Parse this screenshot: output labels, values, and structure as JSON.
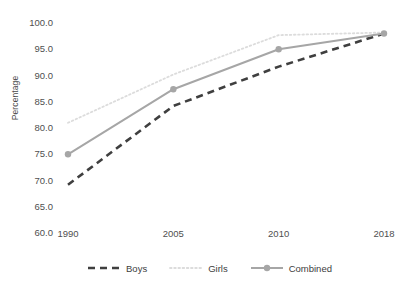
{
  "chart_data": {
    "type": "line",
    "title": "",
    "xlabel": "",
    "ylabel": "Percentage",
    "categories": [
      "1990",
      "2005",
      "2010",
      "2018"
    ],
    "ylim": [
      60.0,
      100.0
    ],
    "ytick_step": 5.0,
    "ytick_labels": [
      "100.0",
      "95.0",
      "90.0",
      "85.0",
      "80.0",
      "75.0",
      "70.0",
      "65.0",
      "60.0"
    ],
    "ytick_values": [
      100.0,
      95.0,
      90.0,
      85.0,
      80.0,
      75.0,
      70.0,
      65.0,
      60.0
    ],
    "grid": false,
    "legend_position": "bottom",
    "series": [
      {
        "name": "Boys",
        "values": [
          69.0,
          84.0,
          91.5,
          97.8
        ],
        "color": "#3f3f3f",
        "style": "dashed",
        "markers": false
      },
      {
        "name": "Girls",
        "values": [
          80.8,
          90.0,
          97.5,
          98.0
        ],
        "color": "#dcdcdc",
        "style": "dotted",
        "markers": false
      },
      {
        "name": "Combined",
        "values": [
          74.8,
          87.2,
          94.8,
          97.8
        ],
        "color": "#a6a6a6",
        "style": "solid",
        "markers": true
      }
    ]
  },
  "axes": {
    "y_title": "Percentage"
  },
  "legend": {
    "items": [
      {
        "label": "Boys"
      },
      {
        "label": "Girls"
      },
      {
        "label": "Combined"
      }
    ]
  }
}
